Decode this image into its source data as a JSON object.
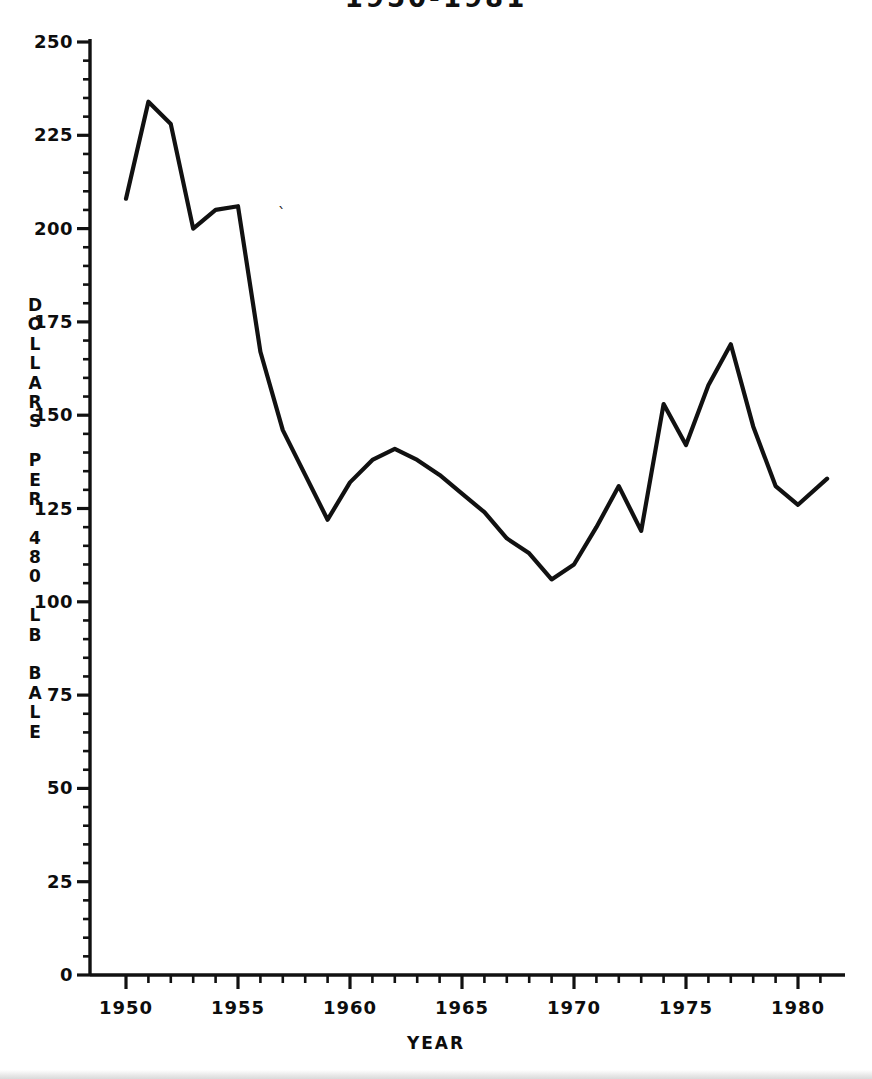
{
  "chart_data": {
    "type": "line",
    "title": "1950-1981",
    "xlabel": "YEAR",
    "ylabel": "DOLLARS PER 480 LB BALE",
    "ylabel_chars": [
      "D",
      "O",
      "L",
      "L",
      "A",
      "R",
      "S",
      "",
      "P",
      "E",
      "R",
      "",
      "4",
      "8",
      "0",
      "",
      "L",
      "B",
      "",
      "B",
      "A",
      "L",
      "E"
    ],
    "xlim": [
      1949.4,
      1981.6
    ],
    "ylim": [
      0,
      250
    ],
    "grid": false,
    "legend": "none",
    "series_name": "Cotton price",
    "x": [
      1950,
      1951,
      1952,
      1953,
      1954,
      1955,
      1956,
      1957,
      1958,
      1959,
      1960,
      1961,
      1962,
      1963,
      1964,
      1965,
      1966,
      1967,
      1968,
      1969,
      1970,
      1971,
      1972,
      1973,
      1974,
      1975,
      1976,
      1977,
      1978,
      1979,
      1980,
      1981.3
    ],
    "values": [
      208,
      234,
      228,
      200,
      205,
      206,
      167,
      146,
      134,
      122,
      132,
      138,
      141,
      138,
      134,
      129,
      124,
      117,
      113,
      106,
      110,
      120,
      131,
      119,
      153,
      142,
      158,
      169,
      147,
      131,
      126,
      133
    ],
    "y_ticks": [
      0,
      25,
      50,
      75,
      100,
      125,
      150,
      175,
      200,
      225,
      250
    ],
    "y_tick_labels": [
      "0",
      "25",
      "50",
      "75",
      "100",
      "125",
      "150",
      "175",
      "200",
      "225",
      "250"
    ],
    "y_minor_tick_interval": 5,
    "x_ticks": [
      1950,
      1955,
      1960,
      1965,
      1970,
      1975,
      1980
    ],
    "x_tick_labels": [
      "1950",
      "1955",
      "1960",
      "1965",
      "1970",
      "1975",
      "1980"
    ],
    "x_minor_tick_interval": 1,
    "line_color": "#111111",
    "axis_color": "#111111",
    "background_color": "#ffffff"
  },
  "artifacts": {
    "stray_mark": "`"
  }
}
